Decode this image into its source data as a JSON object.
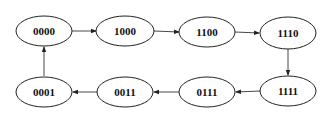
{
  "diagram": {
    "type": "state-cycle",
    "nodes": [
      {
        "id": "n0",
        "label": "0000",
        "cx": 44,
        "cy": 31
      },
      {
        "id": "n1",
        "label": "1000",
        "cx": 125,
        "cy": 31
      },
      {
        "id": "n2",
        "label": "1100",
        "cx": 207,
        "cy": 32
      },
      {
        "id": "n3",
        "label": "1110",
        "cx": 288,
        "cy": 33
      },
      {
        "id": "n4",
        "label": "1111",
        "cx": 288,
        "cy": 91
      },
      {
        "id": "n5",
        "label": "0111",
        "cx": 207,
        "cy": 92
      },
      {
        "id": "n6",
        "label": "0011",
        "cx": 125,
        "cy": 92
      },
      {
        "id": "n7",
        "label": "0001",
        "cx": 44,
        "cy": 92
      }
    ],
    "edges": [
      {
        "from": "0000",
        "to": "1000"
      },
      {
        "from": "1000",
        "to": "1100"
      },
      {
        "from": "1100",
        "to": "1110"
      },
      {
        "from": "1110",
        "to": "1111"
      },
      {
        "from": "1111",
        "to": "0111"
      },
      {
        "from": "0111",
        "to": "0011"
      },
      {
        "from": "0011",
        "to": "0001"
      },
      {
        "from": "0001",
        "to": "0000"
      }
    ],
    "colors": {
      "stroke": "#222222",
      "background": "#ffffff"
    }
  }
}
